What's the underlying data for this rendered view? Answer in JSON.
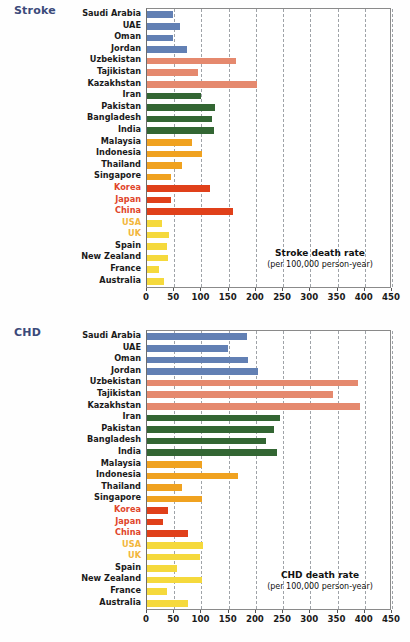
{
  "figure": {
    "background": "#ffffff"
  },
  "chart_data": [
    {
      "type": "bar",
      "orientation": "horizontal",
      "panel_label": "Stroke",
      "title": "Stroke death rate",
      "subtitle": "(per 100,000 person-year)",
      "xlabel": "",
      "ylabel": "",
      "xlim": [
        0,
        450
      ],
      "xticks": [
        0,
        50,
        100,
        150,
        200,
        250,
        300,
        350,
        400,
        450
      ],
      "grid": "vertical-dashed",
      "legend": "none",
      "categories": [
        "Saudi Arabia",
        "UAE",
        "Oman",
        "Jordan",
        "Uzbekistan",
        "Tajikistan",
        "Kazakhstan",
        "Iran",
        "Pakistan",
        "Bangladesh",
        "India",
        "Malaysia",
        "Indonesia",
        "Thailand",
        "Singapore",
        "Korea",
        "Japan",
        "China",
        "USA",
        "UK",
        "Spain",
        "New Zealand",
        "France",
        "Australia"
      ],
      "values": [
        48,
        61,
        48,
        73,
        163,
        93,
        202,
        99,
        125,
        119,
        123,
        83,
        101,
        65,
        44,
        116,
        44,
        158,
        28,
        40,
        36,
        39,
        22,
        31
      ],
      "bar_colors": [
        "#6280b4",
        "#6280b4",
        "#6280b4",
        "#6280b4",
        "#e5896e",
        "#e5896e",
        "#e5896e",
        "#336633",
        "#336633",
        "#336633",
        "#336633",
        "#f0a220",
        "#f0a220",
        "#f0a220",
        "#f0a220",
        "#e0401a",
        "#e0401a",
        "#e0401a",
        "#f5d93c",
        "#f5d93c",
        "#f5d93c",
        "#f5d93c",
        "#f5d93c",
        "#f5d93c"
      ],
      "label_colors": [
        "#1a1a1a",
        "#1a1a1a",
        "#1a1a1a",
        "#1a1a1a",
        "#1a1a1a",
        "#1a1a1a",
        "#1a1a1a",
        "#1a1a1a",
        "#1a1a1a",
        "#1a1a1a",
        "#1a1a1a",
        "#1a1a1a",
        "#1a1a1a",
        "#1a1a1a",
        "#1a1a1a",
        "#e0452a",
        "#e0452a",
        "#e0452a",
        "#f2b63c",
        "#f2b63c",
        "#1a1a1a",
        "#1a1a1a",
        "#1a1a1a",
        "#1a1a1a"
      ]
    },
    {
      "type": "bar",
      "orientation": "horizontal",
      "panel_label": "CHD",
      "title": "CHD death rate",
      "subtitle": "(per 100,000 person-year)",
      "xlabel": "",
      "ylabel": "",
      "xlim": [
        0,
        450
      ],
      "xticks": [
        0,
        50,
        100,
        150,
        200,
        250,
        300,
        350,
        400,
        450
      ],
      "grid": "vertical-dashed",
      "legend": "none",
      "categories": [
        "Saudi Arabia",
        "UAE",
        "Oman",
        "Jordan",
        "Uzbekistan",
        "Tajikistan",
        "Kazakhstan",
        "Iran",
        "Pakistan",
        "Bangladesh",
        "India",
        "Malaysia",
        "Indonesia",
        "Thailand",
        "Singapore",
        "Korea",
        "Japan",
        "China",
        "USA",
        "UK",
        "Spain",
        "New Zealand",
        "France",
        "Australia"
      ],
      "values": [
        184,
        149,
        186,
        204,
        388,
        342,
        391,
        244,
        233,
        219,
        239,
        101,
        167,
        64,
        101,
        38,
        30,
        75,
        103,
        97,
        55,
        101,
        36,
        75
      ],
      "bar_colors": [
        "#6280b4",
        "#6280b4",
        "#6280b4",
        "#6280b4",
        "#e5896e",
        "#e5896e",
        "#e5896e",
        "#336633",
        "#336633",
        "#336633",
        "#336633",
        "#f0a220",
        "#f0a220",
        "#f0a220",
        "#f0a220",
        "#e0401a",
        "#e0401a",
        "#e0401a",
        "#f5d93c",
        "#f5d93c",
        "#f5d93c",
        "#f5d93c",
        "#f5d93c",
        "#f5d93c"
      ],
      "label_colors": [
        "#1a1a1a",
        "#1a1a1a",
        "#1a1a1a",
        "#1a1a1a",
        "#1a1a1a",
        "#1a1a1a",
        "#1a1a1a",
        "#1a1a1a",
        "#1a1a1a",
        "#1a1a1a",
        "#1a1a1a",
        "#1a1a1a",
        "#1a1a1a",
        "#1a1a1a",
        "#1a1a1a",
        "#e0452a",
        "#e0452a",
        "#e0452a",
        "#f2b63c",
        "#f2b63c",
        "#1a1a1a",
        "#1a1a1a",
        "#1a1a1a",
        "#1a1a1a"
      ]
    }
  ]
}
